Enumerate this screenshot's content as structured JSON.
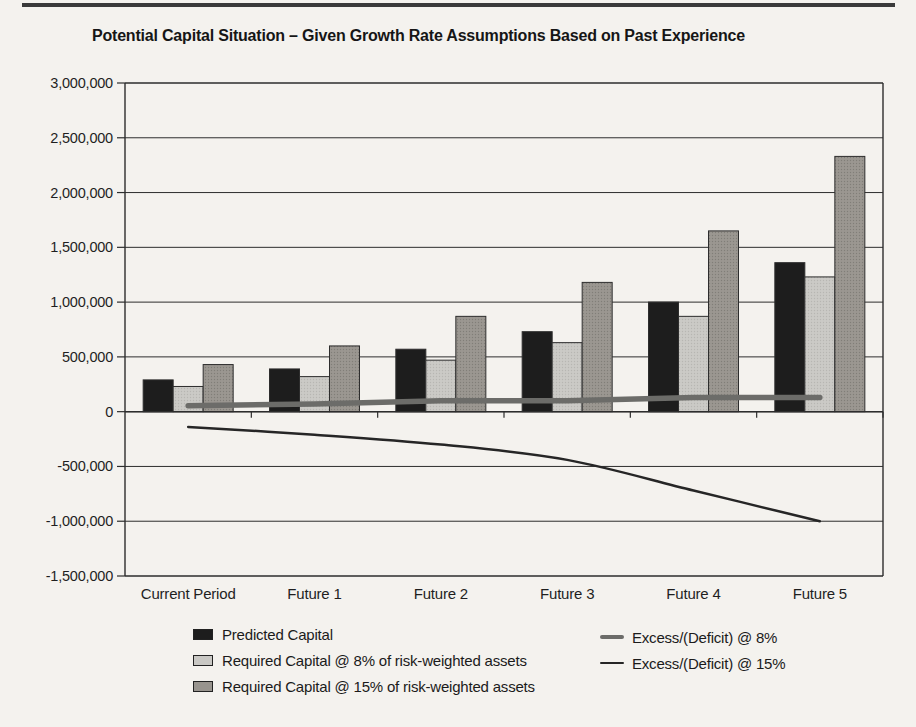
{
  "chart_data": {
    "type": "bar",
    "title": "Potential Capital Situation – Given Growth Rate Assumptions Based on Past Experience",
    "categories": [
      "Current Period",
      "Future 1",
      "Future 2",
      "Future 3",
      "Future 4",
      "Future 5"
    ],
    "series": [
      {
        "name": "Predicted Capital",
        "type": "bar",
        "color": "#1d1d1d",
        "values": [
          290000,
          390000,
          570000,
          730000,
          1000000,
          1360000
        ]
      },
      {
        "name": "Required Capital @ 8% of risk-weighted assets",
        "type": "bar",
        "color": "#c9c8c4",
        "values": [
          230000,
          320000,
          470000,
          630000,
          870000,
          1230000
        ]
      },
      {
        "name": "Required Capital @ 15% of risk-weighted assets",
        "type": "bar",
        "color": "#98948e",
        "values": [
          430000,
          600000,
          870000,
          1180000,
          1650000,
          2330000
        ]
      },
      {
        "name": "Excess/(Deficit) @ 8%",
        "type": "line",
        "color": "#6c6c69",
        "stroke_width": 5.5,
        "values": [
          55000,
          70000,
          100000,
          100000,
          130000,
          130000
        ]
      },
      {
        "name": "Excess/(Deficit) @ 15%",
        "type": "line",
        "color": "#262626",
        "stroke_width": 2.5,
        "values": [
          -140000,
          -210000,
          -300000,
          -440000,
          -720000,
          -1000000
        ]
      }
    ],
    "ylim": [
      -1500000,
      3000000
    ],
    "ytick_step": 500000,
    "ytick_labels": [
      "3,000,000",
      "2,500,000",
      "2,000,000",
      "1,500,000",
      "1,000,000",
      "500,000",
      "0",
      "-500,000",
      "-1,000,000",
      "-1,500,000"
    ],
    "xlabel": "",
    "ylabel": "",
    "grid": "horizontal",
    "legend_position": "bottom",
    "axis_color": "#2d2d2d",
    "background": "#f4f2ee"
  }
}
